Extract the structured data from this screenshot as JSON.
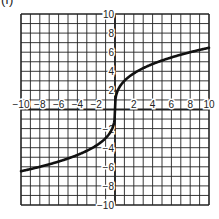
{
  "panel_label": "(f)",
  "chart_data": {
    "type": "line",
    "title": "",
    "xlabel": "",
    "ylabel": "",
    "xlim": [
      -10,
      10
    ],
    "ylim": [
      -10,
      10
    ],
    "grid": true,
    "grid_step": 1,
    "x_tick_labels": [
      "-10",
      "-8",
      "-6",
      "-4",
      "-2",
      "2",
      "4",
      "6",
      "8",
      "10"
    ],
    "y_tick_labels": [
      "10",
      "8",
      "6",
      "4",
      "2",
      "-2",
      "-4",
      "-6",
      "-8",
      "-10"
    ],
    "legend": null,
    "series": [
      {
        "name": "curve",
        "description": "odd, increasing, cube-root-like curve through the origin",
        "x": [
          -10,
          -8,
          -6,
          -4,
          -2,
          -1,
          -0.5,
          -0.1,
          0,
          0.1,
          0.5,
          1,
          2,
          4,
          6,
          8,
          10
        ],
        "y": [
          -6.5,
          -6.0,
          -5.5,
          -4.8,
          -3.8,
          -3.0,
          -2.4,
          -1.4,
          0,
          1.4,
          2.4,
          3.0,
          3.8,
          4.8,
          5.5,
          6.0,
          6.5
        ]
      }
    ]
  },
  "style": {
    "grid_color": "#222222",
    "curve_color": "#111111",
    "background": "#ffffff"
  }
}
